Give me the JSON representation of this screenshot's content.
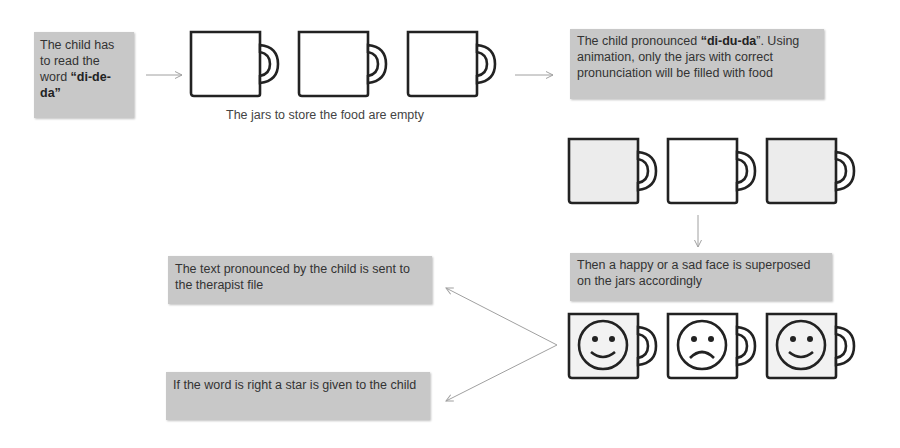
{
  "steps": {
    "read_word": {
      "prefix": "The  child has to read the word ",
      "quote_open": "“",
      "word": "di-de-da",
      "quote_close": "”"
    },
    "empty_jars_caption": "The jars to store the food are empty",
    "pronounced": {
      "prefix": "The  child pronounced ",
      "quote_open": "“",
      "word": "di-du-da",
      "quote_close": "”.",
      "suffix": " Using animation, only the jars with correct pronunciation will be filled with food"
    },
    "faces": "Then a happy or a sad face is superposed on the jars accordingly",
    "therapist": "The text pronounced by the child is sent to the therapist file",
    "star": "If the word is right a star is given to the child"
  },
  "jars": {
    "empty": [
      {
        "icon": "mug-empty-icon",
        "filled": false
      },
      {
        "icon": "mug-empty-icon",
        "filled": false
      },
      {
        "icon": "mug-empty-icon",
        "filled": false
      }
    ],
    "filled": [
      {
        "icon": "mug-filled-icon",
        "filled": true
      },
      {
        "icon": "mug-empty-icon",
        "filled": false
      },
      {
        "icon": "mug-filled-icon",
        "filled": true
      }
    ],
    "faces": [
      {
        "icon": "happy-face-icon",
        "mood": "happy"
      },
      {
        "icon": "sad-face-icon",
        "mood": "sad"
      },
      {
        "icon": "happy-face-icon",
        "mood": "happy"
      }
    ]
  },
  "colors": {
    "box_fill": "#c8c8c8",
    "jar_fill": "#ececec",
    "arrow": "#a0a0a0",
    "outline": "#222222"
  }
}
